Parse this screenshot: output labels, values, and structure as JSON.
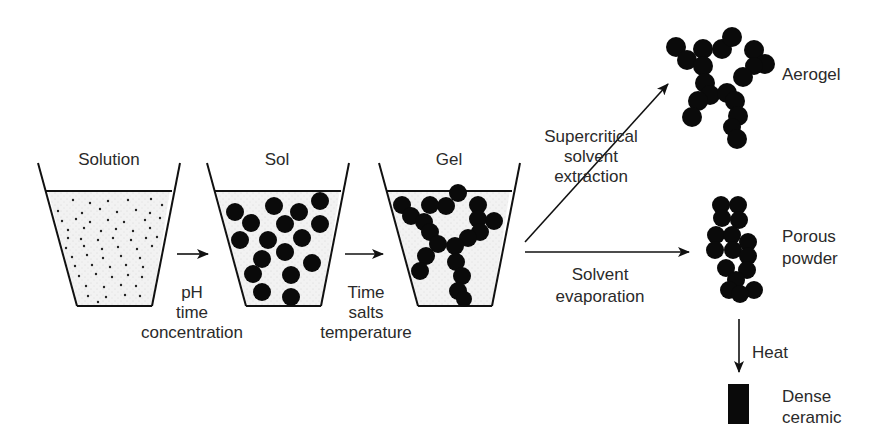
{
  "diagram": {
    "stages": [
      {
        "label": "Solution"
      },
      {
        "label": "Sol"
      },
      {
        "label": "Gel"
      }
    ],
    "transitions": [
      {
        "lines": [
          "pH",
          "time",
          "concentration"
        ]
      },
      {
        "lines": [
          "Time",
          "salts",
          "temperature"
        ]
      }
    ],
    "branches": {
      "supercritical": {
        "lines": [
          "Supercritical",
          "solvent",
          "extraction"
        ]
      },
      "evaporation": {
        "lines": [
          "Solvent",
          "evaporation"
        ]
      },
      "heat": {
        "label": "Heat"
      }
    },
    "products": {
      "aerogel": {
        "label": "Aerogel"
      },
      "porous_powder": {
        "lines": [
          "Porous",
          "powder"
        ]
      },
      "dense_ceramic": {
        "lines": [
          "Dense",
          "ceramic"
        ]
      }
    },
    "colors": {
      "ink": "#111111",
      "fill": "#efefef",
      "text": "#2a2a2a"
    }
  }
}
